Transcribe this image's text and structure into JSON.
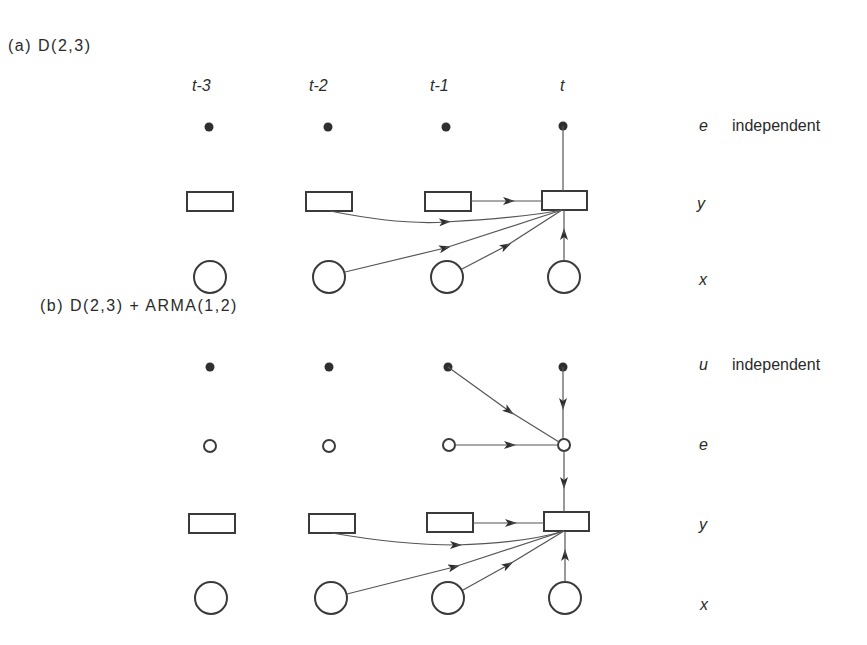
{
  "panel_a": {
    "title": "(a)  D(2,3)",
    "time_labels": [
      "t-3",
      "t-2",
      "t-1",
      "t"
    ],
    "row_labels": {
      "e": "e",
      "e_desc": "independent",
      "y": "y",
      "x": "x"
    }
  },
  "panel_b": {
    "title": "(b)  D(2,3) + ARMA(1,2)",
    "row_labels": {
      "u": "u",
      "u_desc": "independent",
      "e": "e",
      "y": "y",
      "x": "x"
    }
  }
}
